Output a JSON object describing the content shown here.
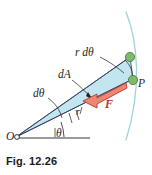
{
  "figure": {
    "caption": "Fig. 12.26",
    "colors": {
      "sector_fill": "#bfe4ef",
      "sector_stroke": "#2f3b63",
      "arc_stroke": "#9fd3e3",
      "force_arrow_fill": "#f08573",
      "force_arrow_stroke": "#b03a2e",
      "point_fill": "#7fba6a",
      "point_stroke": "#4e7a3e",
      "line_stroke": "#231f20",
      "label_text": "#231f20",
      "force_label": "#b03a2e",
      "caption_text": "#1a1a1a"
    },
    "labels": {
      "arc_length": "r dθ",
      "area_element": "dA",
      "angle_increment": "dθ",
      "radius": "r",
      "polar_angle": "θ",
      "origin": "O",
      "point": "P",
      "force": "F"
    },
    "icons": {
      "origin_marker": "small-open-circle",
      "point_marker": "filled-green-circle",
      "force_marker": "left-pointing-arrow"
    }
  }
}
